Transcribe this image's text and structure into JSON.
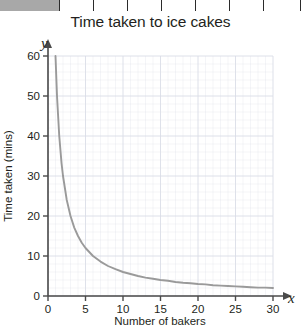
{
  "table_strip": {
    "header_cell_label": "",
    "cells": [
      "",
      "",
      "",
      "",
      "",
      "",
      "",
      ""
    ]
  },
  "chart_data": {
    "type": "line",
    "title": "Time taken to ice cakes",
    "xlabel": "Number of bakers",
    "ylabel": "Time taken (mins)",
    "x_axis_letter": "x",
    "y_axis_letter": "y",
    "xlim": [
      0,
      30
    ],
    "ylim": [
      0,
      60
    ],
    "xticks": [
      0,
      5,
      10,
      15,
      20,
      25,
      30
    ],
    "yticks": [
      0,
      10,
      20,
      30,
      40,
      50,
      60
    ],
    "xtick_labels": [
      "0",
      "5",
      "10",
      "15",
      "20",
      "25",
      "30"
    ],
    "ytick_labels": [
      "0",
      "10",
      "20",
      "30",
      "40",
      "50",
      "60"
    ],
    "grid": true,
    "grid_major_x_step": 5,
    "grid_major_y_step": 10,
    "grid_minor_x_step": 1,
    "grid_minor_y_step": 2,
    "legend": null,
    "relationship": "y = 60 / x",
    "curve_color": "#9a9a9a",
    "grid_color": "#d9dce6",
    "axis_color": "#4a4a4a",
    "series": [
      {
        "name": "Time taken",
        "x": [
          1.0,
          1.2,
          1.5,
          1.8,
          2.0,
          2.5,
          3.0,
          3.5,
          4.0,
          4.5,
          5.0,
          6.0,
          7.0,
          8.0,
          9.0,
          10.0,
          11.0,
          12.0,
          13.0,
          14.0,
          15.0,
          16.0,
          17.0,
          18.0,
          19.0,
          20.0,
          21.0,
          22.0,
          23.0,
          24.0,
          25.0,
          26.0,
          27.0,
          28.0,
          29.0,
          30.0
        ],
        "y": [
          60.0,
          50.0,
          40.0,
          33.3,
          30.0,
          24.0,
          20.0,
          17.1,
          15.0,
          13.3,
          12.0,
          10.0,
          8.6,
          7.5,
          6.7,
          6.0,
          5.5,
          5.0,
          4.6,
          4.3,
          4.0,
          3.8,
          3.5,
          3.3,
          3.2,
          3.0,
          2.9,
          2.7,
          2.6,
          2.5,
          2.4,
          2.3,
          2.2,
          2.1,
          2.1,
          2.0
        ]
      }
    ]
  }
}
